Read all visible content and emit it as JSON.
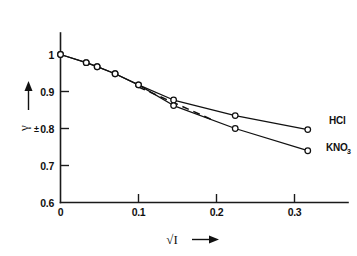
{
  "chart_data": {
    "type": "line",
    "title": "",
    "subtitle": "",
    "xlabel": "√I",
    "xlabel_arrow": "→",
    "ylabel": "γ",
    "ylabel_subscript": "±",
    "ylabel_arrow": "↑",
    "xlim": [
      0,
      0.35
    ],
    "ylim": [
      0.6,
      1.02
    ],
    "xticks": [
      0,
      0.1,
      0.2,
      0.3
    ],
    "xtick_labels": [
      "0",
      "0.1",
      "0.2",
      "0.3"
    ],
    "yticks": [
      0.6,
      0.7,
      0.8,
      0.9,
      1.0
    ],
    "ytick_labels": [
      "0.6",
      "0.7",
      "0.8",
      "0.9",
      "1"
    ],
    "grid": false,
    "legend_position": "right-inline",
    "series": [
      {
        "name": "HCl",
        "label": "HCl",
        "label_main": "HCl",
        "label_sub": "",
        "style": "solid-with-markers",
        "x": [
          0.0,
          0.033,
          0.047,
          0.07,
          0.1,
          0.145,
          0.224,
          0.317
        ],
        "y": [
          1.0,
          0.978,
          0.967,
          0.948,
          0.918,
          0.877,
          0.835,
          0.797
        ]
      },
      {
        "name": "KNO3",
        "label": "KNO₃",
        "label_main": "KNO",
        "label_sub": "3",
        "style": "solid-with-markers",
        "x": [
          0.0,
          0.033,
          0.047,
          0.07,
          0.1,
          0.145,
          0.224,
          0.317
        ],
        "y": [
          1.0,
          0.978,
          0.967,
          0.948,
          0.918,
          0.862,
          0.8,
          0.74
        ]
      },
      {
        "name": "limiting-law",
        "label": "",
        "label_main": "",
        "label_sub": "",
        "style": "dashed",
        "x": [
          0.1,
          0.195
        ],
        "y": [
          0.912,
          0.823
        ]
      }
    ],
    "annotations": []
  }
}
